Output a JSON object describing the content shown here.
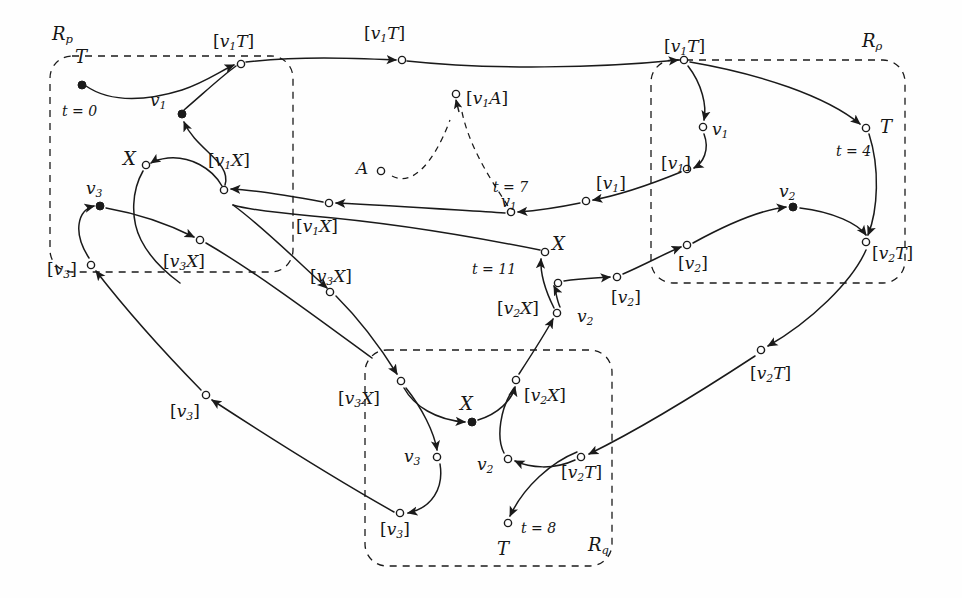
{
  "figure": {
    "type": "diagram",
    "kind": "labelled-transition-graph",
    "background": "#fefefe",
    "stroke": "#1a1a1a",
    "regions": [
      {
        "id": "Rp",
        "label": "R",
        "sub": "p",
        "label_x": 52,
        "label_y": 22,
        "x": 50,
        "y": 56,
        "w": 243,
        "h": 216
      },
      {
        "id": "Rrho",
        "label": "R",
        "sub": "ρ",
        "label_x": 864,
        "label_y": 30,
        "x": 651,
        "y": 60,
        "w": 254,
        "h": 223
      },
      {
        "id": "Rq",
        "label": "R",
        "sub": "q",
        "label_x": 582,
        "label_y": 538,
        "x": 365,
        "y": 350,
        "w": 247,
        "h": 216
      }
    ],
    "labels": [
      {
        "name": "region-label-rp",
        "text": "R",
        "sub": "p",
        "x": 52,
        "y": 25,
        "size": 18
      },
      {
        "name": "region-label-rrho",
        "text": "R",
        "sub": "ρ",
        "x": 862,
        "y": 32,
        "size": 18
      },
      {
        "name": "region-label-rq",
        "text": "R",
        "sub": "q",
        "x": 588,
        "y": 536,
        "size": 18
      },
      {
        "name": "node-label-T-start",
        "text": "T",
        "x": 75,
        "y": 48,
        "size": 18
      },
      {
        "name": "time-label-t0",
        "text": "t = 0",
        "x": 62,
        "y": 104,
        "size": 14
      },
      {
        "name": "node-label-v1-left",
        "text": "v",
        "sub": "1",
        "x": 150,
        "y": 92,
        "size": 17
      },
      {
        "name": "edge-label-v1T-a",
        "text": "[v",
        "sub": "1",
        "tail": "T]",
        "x": 213,
        "y": 33,
        "size": 17
      },
      {
        "name": "edge-label-v1T-b",
        "text": "[v",
        "sub": "1",
        "tail": "T]",
        "x": 364,
        "y": 25,
        "size": 17
      },
      {
        "name": "edge-label-v1T-c",
        "text": "[v",
        "sub": "1",
        "tail": "T]",
        "x": 664,
        "y": 38,
        "size": 17
      },
      {
        "name": "node-label-X-upper",
        "text": "X",
        "x": 123,
        "y": 150,
        "size": 18
      },
      {
        "name": "edge-label-v1X-a",
        "text": "[v",
        "sub": "1",
        "tail": "X]",
        "x": 208,
        "y": 152,
        "size": 17
      },
      {
        "name": "edge-label-v1X-b",
        "text": "[v",
        "sub": "1",
        "tail": "X]",
        "x": 296,
        "y": 218,
        "size": 17
      },
      {
        "name": "node-label-v3-upper",
        "text": "v",
        "sub": "3",
        "x": 86,
        "y": 180,
        "size": 17
      },
      {
        "name": "node-label-A",
        "text": "A",
        "x": 356,
        "y": 160,
        "size": 17
      },
      {
        "name": "edge-label-v1A",
        "text": "[v",
        "sub": "1",
        "tail": "A]",
        "x": 466,
        "y": 90,
        "size": 17
      },
      {
        "name": "time-label-t7",
        "text": "t = 7",
        "x": 493,
        "y": 180,
        "size": 14
      },
      {
        "name": "node-label-v1-mid",
        "text": "v",
        "sub": "1",
        "x": 501,
        "y": 194,
        "size": 16
      },
      {
        "name": "edge-label-v1-a",
        "text": "[v",
        "sub": "1",
        "tail": "]",
        "x": 596,
        "y": 175,
        "size": 17
      },
      {
        "name": "edge-label-v1-b",
        "text": "[v",
        "sub": "1",
        "tail": "]",
        "x": 661,
        "y": 155,
        "size": 17
      },
      {
        "name": "node-label-v1-right",
        "text": "v",
        "sub": "1",
        "x": 712,
        "y": 121,
        "size": 17
      },
      {
        "name": "node-label-T-t4",
        "text": "T",
        "x": 880,
        "y": 118,
        "size": 18
      },
      {
        "name": "time-label-t4",
        "text": "t = 4",
        "x": 836,
        "y": 144,
        "size": 14
      },
      {
        "name": "node-label-v2-right",
        "text": "v",
        "sub": "2",
        "x": 779,
        "y": 183,
        "size": 17
      },
      {
        "name": "edge-label-v2-a",
        "text": "[v",
        "sub": "2",
        "tail": "]",
        "x": 678,
        "y": 255,
        "size": 17
      },
      {
        "name": "edge-label-v2T-top",
        "text": "[v",
        "sub": "2",
        "tail": "T]",
        "x": 872,
        "y": 245,
        "size": 17
      },
      {
        "name": "edge-label-v2T-mid",
        "text": "[v",
        "sub": "2",
        "tail": "T]",
        "x": 750,
        "y": 365,
        "size": 17
      },
      {
        "name": "edge-label-v3X-a",
        "text": "[v",
        "sub": "3",
        "tail": "X]",
        "x": 163,
        "y": 253,
        "size": 17
      },
      {
        "name": "edge-label-v3X-b",
        "text": "[v",
        "sub": "3",
        "tail": "X]",
        "x": 310,
        "y": 268,
        "size": 17
      },
      {
        "name": "edge-label-v3-a",
        "text": "[v",
        "sub": "3",
        "tail": "]",
        "x": 47,
        "y": 261,
        "size": 17
      },
      {
        "name": "edge-label-v3-b",
        "text": "[v",
        "sub": "3",
        "tail": "]",
        "x": 170,
        "y": 403,
        "size": 17
      },
      {
        "name": "node-label-X-t11",
        "text": "X",
        "x": 552,
        "y": 235,
        "size": 18
      },
      {
        "name": "time-label-t11",
        "text": "t = 11",
        "x": 472,
        "y": 262,
        "size": 14
      },
      {
        "name": "edge-label-v2X-a",
        "text": "[v",
        "sub": "2",
        "tail": "X]",
        "x": 497,
        "y": 300,
        "size": 17
      },
      {
        "name": "node-label-v2-mid",
        "text": "v",
        "sub": "2",
        "x": 577,
        "y": 308,
        "size": 17
      },
      {
        "name": "edge-label-v2-b",
        "text": "[v",
        "sub": "2",
        "tail": "]",
        "x": 611,
        "y": 289,
        "size": 17
      },
      {
        "name": "edge-label-v3X-c",
        "text": "[v",
        "sub": "3",
        "tail": "X]",
        "x": 338,
        "y": 390,
        "size": 17
      },
      {
        "name": "node-label-X-bottom",
        "text": "X",
        "x": 460,
        "y": 395,
        "size": 18
      },
      {
        "name": "edge-label-v2X-b",
        "text": "[v",
        "sub": "2",
        "tail": "X]",
        "x": 524,
        "y": 387,
        "size": 17
      },
      {
        "name": "node-label-v3-bottom",
        "text": "v",
        "sub": "3",
        "x": 404,
        "y": 448,
        "size": 17
      },
      {
        "name": "node-label-v2-bottom",
        "text": "v",
        "sub": "2",
        "x": 477,
        "y": 456,
        "size": 17
      },
      {
        "name": "edge-label-v2T-bottom",
        "text": "[v",
        "sub": "2",
        "tail": "T]",
        "x": 561,
        "y": 464,
        "size": 17
      },
      {
        "name": "edge-label-v3-c",
        "text": "[v",
        "sub": "3",
        "tail": "]",
        "x": 380,
        "y": 521,
        "size": 17
      },
      {
        "name": "time-label-t8",
        "text": "t = 8",
        "x": 521,
        "y": 521,
        "size": 14
      },
      {
        "name": "node-label-T-t8",
        "text": "T",
        "x": 497,
        "y": 540,
        "size": 18
      }
    ],
    "nodes": [
      {
        "name": "node-T-start",
        "x": 82,
        "y": 85,
        "filled": true
      },
      {
        "name": "node-v1-left",
        "x": 182,
        "y": 114,
        "filled": true
      },
      {
        "name": "node-v1T-a",
        "x": 241,
        "y": 64,
        "filled": false
      },
      {
        "name": "node-v1T-b",
        "x": 402,
        "y": 60,
        "filled": false
      },
      {
        "name": "node-v1T-c",
        "x": 684,
        "y": 60,
        "filled": false
      },
      {
        "name": "node-X-upper",
        "x": 146,
        "y": 165,
        "filled": false
      },
      {
        "name": "node-v1X-a",
        "x": 224,
        "y": 190,
        "filled": false
      },
      {
        "name": "node-v1X-b",
        "x": 329,
        "y": 203,
        "filled": false
      },
      {
        "name": "node-v3-upper",
        "x": 100,
        "y": 206,
        "filled": true
      },
      {
        "name": "node-A",
        "x": 381,
        "y": 171,
        "filled": false
      },
      {
        "name": "node-v1A",
        "x": 456,
        "y": 94,
        "filled": false
      },
      {
        "name": "node-v1-mid",
        "x": 511,
        "y": 212,
        "filled": false
      },
      {
        "name": "node-v1-a",
        "x": 586,
        "y": 201,
        "filled": false
      },
      {
        "name": "node-v1-b",
        "x": 687,
        "y": 169,
        "filled": false
      },
      {
        "name": "node-v1-right",
        "x": 703,
        "y": 127,
        "filled": false
      },
      {
        "name": "node-T-t4",
        "x": 866,
        "y": 128,
        "filled": false
      },
      {
        "name": "node-v2-right",
        "x": 793,
        "y": 207,
        "filled": true
      },
      {
        "name": "node-v2-a",
        "x": 687,
        "y": 245,
        "filled": false
      },
      {
        "name": "node-v2T-top",
        "x": 866,
        "y": 242,
        "filled": false
      },
      {
        "name": "node-v2T-mid",
        "x": 761,
        "y": 350,
        "filled": false
      },
      {
        "name": "node-v3X-a",
        "x": 200,
        "y": 240,
        "filled": false
      },
      {
        "name": "node-v3X-b",
        "x": 330,
        "y": 292,
        "filled": false
      },
      {
        "name": "node-v3-a",
        "x": 91,
        "y": 265,
        "filled": false
      },
      {
        "name": "node-v3-b",
        "x": 206,
        "y": 395,
        "filled": false
      },
      {
        "name": "node-X-t11",
        "x": 545,
        "y": 252,
        "filled": false
      },
      {
        "name": "node-v2X-a",
        "x": 557,
        "y": 313,
        "filled": false
      },
      {
        "name": "node-v2-mid",
        "x": 558,
        "y": 283,
        "filled": false
      },
      {
        "name": "node-v2-b",
        "x": 617,
        "y": 277,
        "filled": false
      },
      {
        "name": "node-v3X-c",
        "x": 401,
        "y": 381,
        "filled": false
      },
      {
        "name": "node-X-bottom",
        "x": 472,
        "y": 422,
        "filled": true
      },
      {
        "name": "node-v2X-b",
        "x": 516,
        "y": 380,
        "filled": false
      },
      {
        "name": "node-v3-bottom",
        "x": 437,
        "y": 457,
        "filled": false
      },
      {
        "name": "node-v2-bottom",
        "x": 508,
        "y": 459,
        "filled": false
      },
      {
        "name": "node-v2T-bottom",
        "x": 581,
        "y": 457,
        "filled": false
      },
      {
        "name": "node-v3-c",
        "x": 400,
        "y": 513,
        "filled": false
      },
      {
        "name": "node-T-t8",
        "x": 508,
        "y": 523,
        "filled": false
      }
    ]
  }
}
